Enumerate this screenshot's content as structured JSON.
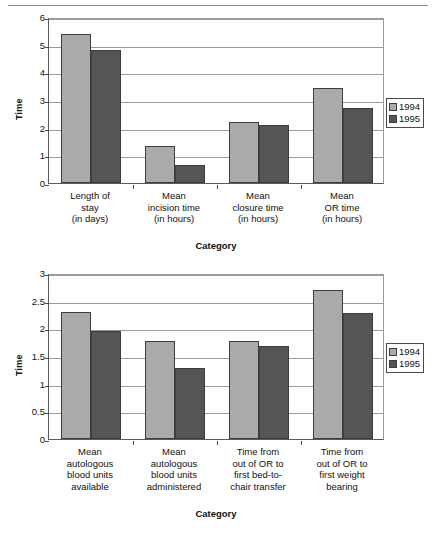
{
  "page": {
    "top_rule": "horizontal-rule"
  },
  "charts": [
    {
      "id": "chart-top",
      "ylabel": "Time",
      "xlabel": "Category",
      "legend": {
        "items": [
          "1994",
          "1995"
        ]
      }
    },
    {
      "id": "chart-bottom",
      "ylabel": "Time",
      "xlabel": "Category",
      "legend": {
        "items": [
          "1994",
          "1995"
        ]
      }
    }
  ],
  "chart_data": [
    {
      "type": "bar",
      "title": "",
      "xlabel": "Category",
      "ylabel": "Time",
      "ylim": [
        0,
        6
      ],
      "yticks": [
        0,
        1,
        2,
        3,
        4,
        5,
        6
      ],
      "grid": true,
      "legend_position": "right",
      "categories": [
        "Length of\nstay\n(in days)",
        "Mean\nincision time\n(in hours)",
        "Mean\nclosure time\n(in hours)",
        "Mean\nOR time\n(in hours)"
      ],
      "series": [
        {
          "name": "1994",
          "color": "#aaaaaa",
          "values": [
            5.4,
            1.35,
            2.2,
            3.45
          ]
        },
        {
          "name": "1995",
          "color": "#555555",
          "values": [
            4.8,
            0.65,
            2.1,
            2.7
          ]
        }
      ]
    },
    {
      "type": "bar",
      "title": "",
      "xlabel": "Category",
      "ylabel": "Time",
      "ylim": [
        0,
        3
      ],
      "yticks": [
        0,
        0.5,
        1,
        1.5,
        2,
        2.5,
        3
      ],
      "ytick_labels": [
        "0",
        "0.5",
        "1",
        "1.5",
        "2",
        "2.5",
        "3"
      ],
      "grid": true,
      "legend_position": "right",
      "categories": [
        "Mean\nautologous\nblood units\navailable",
        "Mean\nautologous\nblood units\nadministered",
        "Time from\nout of OR to\nfirst bed-to-\nchair transfer",
        "Time from\nout of OR to\nfirst weight\nbearing"
      ],
      "series": [
        {
          "name": "1994",
          "color": "#aaaaaa",
          "values": [
            2.3,
            1.77,
            1.78,
            2.7
          ]
        },
        {
          "name": "1995",
          "color": "#555555",
          "values": [
            1.95,
            1.28,
            1.68,
            2.28
          ]
        }
      ]
    }
  ]
}
